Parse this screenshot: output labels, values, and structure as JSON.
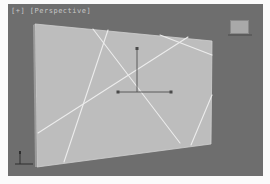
{
  "viewport": {
    "label": "[+] [Perspective]",
    "background_color": "#6e6e6e"
  },
  "scene": {
    "panel": {
      "fill_color": "#bdbdbd",
      "edge_color": "#d4d4d4",
      "corners": [
        [
          35,
          24
        ],
        [
          212,
          41
        ],
        [
          211,
          144
        ],
        [
          37,
          167
        ]
      ]
    },
    "crack_lines_color": "#ececec",
    "gizmo": {
      "axis_color": "#5a5a5a",
      "handle_color": "#4a4a4a"
    }
  },
  "widgets": {
    "viewcube_icon": "viewcube-icon",
    "axis_tripod_icon": "axis-tripod-icon",
    "move_gizmo_icon": "move-gizmo-icon"
  }
}
